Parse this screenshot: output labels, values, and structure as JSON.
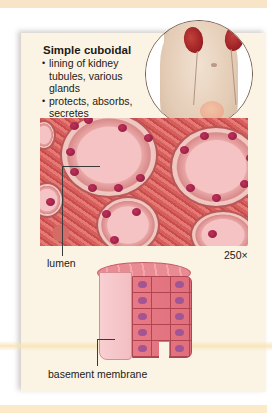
{
  "figure": {
    "title": "Simple cuboidal",
    "bullets": [
      "lining of kidney tubules, various glands",
      "protects, absorbs, secretes"
    ],
    "labels": {
      "lumen": "lumen",
      "magnification": "250×",
      "basement_membrane": "basement membrane"
    },
    "inset": {
      "subject": "kidneys, ureters and bladder in torso"
    },
    "colors": {
      "panel_background": "#fbf4e4",
      "band": "#f8e4c6",
      "tissue_stain": "#d65e5c",
      "kidney": "#9a1e22",
      "nucleus": "#8a1a3d"
    }
  }
}
